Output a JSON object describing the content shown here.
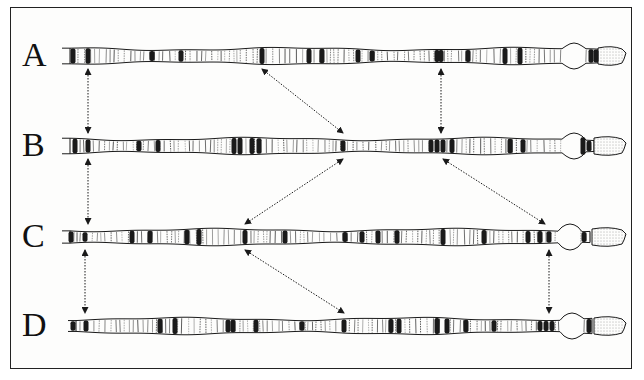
{
  "figure": {
    "rows": [
      {
        "label": "A",
        "y": 56,
        "x0": 62,
        "x1": 626,
        "dark_bands": [
          73,
          88,
          152,
          181,
          262,
          309,
          322,
          358,
          372,
          437,
          441,
          468,
          505,
          520,
          591,
          596
        ],
        "bulge_at": 574,
        "tip_stipple": [
          598,
          624
        ]
      },
      {
        "label": "B",
        "y": 146,
        "x0": 62,
        "x1": 626,
        "dark_bands": [
          75,
          88,
          139,
          158,
          234,
          240,
          252,
          259,
          343,
          431,
          437,
          443,
          452,
          510,
          523,
          583,
          589
        ],
        "bulge_at": 574,
        "tip_stipple": [
          594,
          624
        ]
      },
      {
        "label": "C",
        "y": 237,
        "x0": 62,
        "x1": 626,
        "dark_bands": [
          71,
          85,
          132,
          150,
          187,
          199,
          245,
          285,
          345,
          362,
          378,
          397,
          443,
          484,
          528,
          540,
          549,
          584
        ],
        "bulge_at": 570,
        "tip_stipple": [
          592,
          624
        ]
      },
      {
        "label": "D",
        "y": 326,
        "x0": 68,
        "x1": 626,
        "dark_bands": [
          73,
          86,
          160,
          175,
          228,
          233,
          256,
          302,
          344,
          391,
          399,
          437,
          447,
          466,
          494,
          540,
          546,
          552,
          589
        ],
        "bulge_at": 572,
        "tip_stipple": [
          594,
          624
        ]
      }
    ],
    "arrows": [
      {
        "from": [
          88,
          69
        ],
        "to": [
          88,
          133
        ],
        "style": "dotted"
      },
      {
        "from": [
          262,
          69
        ],
        "to": [
          343,
          133
        ],
        "style": "dotted"
      },
      {
        "from": [
          441,
          69
        ],
        "to": [
          441,
          133
        ],
        "style": "dotted"
      },
      {
        "from": [
          88,
          159
        ],
        "to": [
          88,
          224
        ],
        "style": "dotted"
      },
      {
        "from": [
          343,
          159
        ],
        "to": [
          245,
          224
        ],
        "style": "dotted"
      },
      {
        "from": [
          443,
          159
        ],
        "to": [
          545,
          224
        ],
        "style": "dotted"
      },
      {
        "from": [
          85,
          250
        ],
        "to": [
          85,
          313
        ],
        "style": "dotted"
      },
      {
        "from": [
          245,
          250
        ],
        "to": [
          344,
          313
        ],
        "style": "dotted"
      },
      {
        "from": [
          549,
          250
        ],
        "to": [
          549,
          313
        ],
        "style": "dotted"
      }
    ],
    "colors": {
      "ink": "#1a1a1a",
      "paper": "#fdfdfc",
      "border": "#222222"
    }
  }
}
